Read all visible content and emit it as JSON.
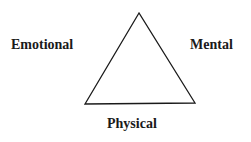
{
  "diagram": {
    "shape": "triangle",
    "labels": {
      "left": "Emotional",
      "right": "Mental",
      "bottom": "Physical"
    },
    "colors": {
      "stroke": "#1a1a1a",
      "text": "#1a1a1a",
      "background": "#ffffff"
    }
  }
}
